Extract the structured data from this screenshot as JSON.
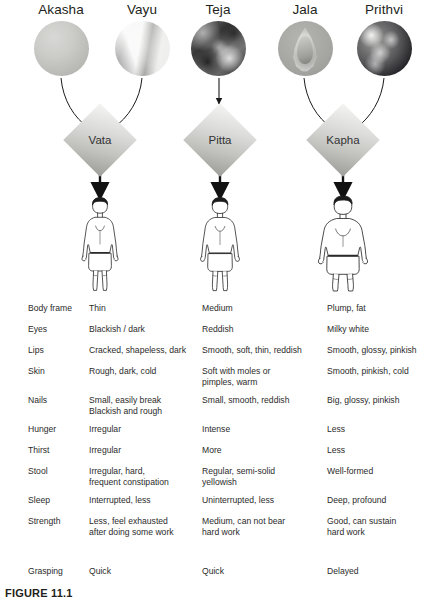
{
  "figure": {
    "caption": "FIGURE 11.1"
  },
  "elements": [
    {
      "label": "Akasha",
      "icon": "sphere-smooth-grey-icon"
    },
    {
      "label": "Vayu",
      "icon": "sphere-wind-streaks-icon"
    },
    {
      "label": "Teja",
      "icon": "sphere-fire-mottled-icon"
    },
    {
      "label": "Jala",
      "icon": "sphere-water-droplet-icon"
    },
    {
      "label": "Prithvi",
      "icon": "sphere-earth-globe-icon"
    }
  ],
  "doshas": [
    {
      "label": "Vata",
      "icon": "diamond-icon"
    },
    {
      "label": "Pitta",
      "icon": "diamond-icon"
    },
    {
      "label": "Kapha",
      "icon": "diamond-icon"
    }
  ],
  "body_figures": [
    {
      "name": "thin-body-figure"
    },
    {
      "name": "medium-body-figure"
    },
    {
      "name": "plump-body-figure"
    }
  ],
  "table": {
    "rows": [
      {
        "trait": "Body frame",
        "vata": "Thin",
        "pitta": "Medium",
        "kapha": "Plump, fat"
      },
      {
        "trait": "Eyes",
        "vata": "Blackish / dark",
        "pitta": "Reddish",
        "kapha": "Milky white"
      },
      {
        "trait": "Lips",
        "vata": "Cracked, shapeless, dark",
        "pitta": "Smooth, soft, thin, reddish",
        "kapha": "Smooth, glossy, pinkish"
      },
      {
        "trait": "Skin",
        "vata": "Rough, dark, cold",
        "pitta": "Soft with moles or\npimples, warm",
        "kapha": "Smooth, pinkish, cold"
      },
      {
        "trait": "Nails",
        "vata": "Small, easily break\nBlackish and rough",
        "pitta": "Small, smooth, reddish",
        "kapha": "Big, glossy, pinkish"
      },
      {
        "trait": "Hunger",
        "vata": "Irregular",
        "pitta": "Intense",
        "kapha": "Less"
      },
      {
        "trait": "Thirst",
        "vata": "Irregular",
        "pitta": "More",
        "kapha": "Less"
      },
      {
        "trait": "Stool",
        "vata": "Irregular, hard,\nfrequent constipation",
        "pitta": "Regular, semi-solid\nyellowish",
        "kapha": "Well-formed"
      },
      {
        "trait": "Sleep",
        "vata": "Interrupted, less",
        "pitta": "Uninterrupted, less",
        "kapha": "Deep, profound"
      },
      {
        "trait": "Strength",
        "vata": "Less, feel exhausted\nafter doing some work",
        "pitta": "Medium, can not bear\nhard work",
        "kapha": "Good, can sustain\nhard work"
      },
      {
        "trait": "Grasping",
        "vata": "Quick",
        "pitta": "Quick",
        "kapha": "Delayed"
      }
    ]
  },
  "colors": {
    "text": "#231f20",
    "table_text": "#2b2b2b",
    "arrow": "#1a1a1a",
    "diamond_light": "#f4f4f3",
    "diamond_dark": "#9d9d99",
    "background": "#ffffff"
  }
}
